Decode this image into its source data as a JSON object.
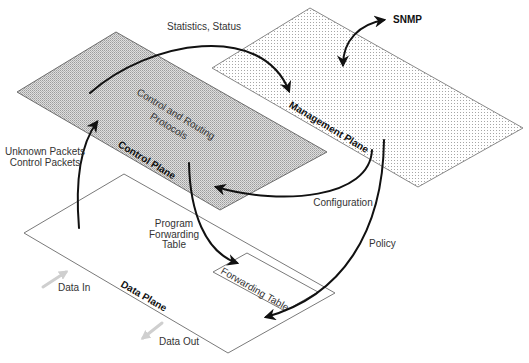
{
  "diagram": {
    "planes": {
      "control": {
        "label": "Control Plane",
        "inner_line1": "Control and Routing",
        "inner_line2": "Protocols"
      },
      "management": {
        "label": "Management Plane"
      },
      "data": {
        "label": "Data Plane",
        "forwarding_table": "Forwarding Table"
      }
    },
    "flows": {
      "statistics": "Statistics, Status",
      "snmp": "SNMP",
      "unknown_packets": [
        "Unknown Packets",
        "Control Packets"
      ],
      "configuration": "Configuration",
      "program_forwarding": [
        "Program",
        "Forwarding",
        "Table"
      ],
      "policy": "Policy",
      "data_in": "Data In",
      "data_out": "Data Out"
    },
    "colors": {
      "arrow": "#111111",
      "io_arrow": "#cfcfcf",
      "control_fill_base": "#dedede",
      "control_fill_dot": "#9c9c9c",
      "management_fill_dot": "#a6a6a6",
      "plane_outline": "#7a7a7a",
      "data_plane_fill": "#ffffff"
    }
  }
}
